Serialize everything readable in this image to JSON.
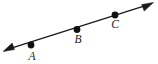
{
  "figure": {
    "type": "geometry-diagram",
    "background_color": "#ffffff",
    "stroke_color": "#1a1a1a",
    "point_fill_color": "#111111",
    "canvas": {
      "width": 158,
      "height": 64
    },
    "line": {
      "name": "double-headed-line",
      "arrow_start": true,
      "arrow_end": true,
      "start": {
        "x": 4,
        "y": 50.5
      },
      "end": {
        "x": 152,
        "y": 3.5
      },
      "stroke_width": 1.4
    },
    "arrowheads": [
      {
        "name": "arrowhead-left",
        "tip": {
          "x": 3,
          "y": 51
        },
        "direction": "down-left"
      },
      {
        "name": "arrowhead-right",
        "tip": {
          "x": 153,
          "y": 3
        },
        "direction": "up-right"
      }
    ],
    "points": [
      {
        "label": "A",
        "dot": {
          "x": 31,
          "y": 45,
          "r": 3.3
        },
        "label_pos": {
          "x": 32,
          "y": 51
        }
      },
      {
        "label": "B",
        "dot": {
          "x": 77,
          "y": 29.5,
          "r": 3.3
        },
        "label_pos": {
          "x": 78,
          "y": 34
        }
      },
      {
        "label": "C",
        "dot": {
          "x": 115,
          "y": 15,
          "r": 3.3
        },
        "label_pos": {
          "x": 115,
          "y": 19
        }
      }
    ]
  }
}
